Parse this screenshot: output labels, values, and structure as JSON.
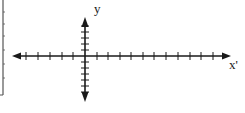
{
  "diagram": {
    "type": "coordinate-axes",
    "labels": {
      "y_axis": "y",
      "x_axis": "x'"
    },
    "colors": {
      "axis": "#1a1a1a",
      "background": "#ffffff",
      "frame": "#555555"
    },
    "x_axis": {
      "y_px": 56,
      "x_start_px": 12,
      "x_end_px": 231,
      "ticks_px": [
        26,
        38,
        50,
        62,
        73,
        97,
        108,
        120,
        131,
        143,
        154,
        166,
        178,
        190,
        201,
        213
      ],
      "arrows": [
        "left",
        "right"
      ]
    },
    "y_axis": {
      "x_px": 85,
      "y_start_px": 17,
      "y_end_px": 102,
      "ticks_px": [
        26,
        32,
        38,
        44,
        50,
        62,
        68,
        74,
        80,
        86,
        92
      ],
      "arrows": [
        "up",
        "down"
      ]
    },
    "left_frame": {
      "x_px": 3,
      "y_top_px": 0,
      "y_bottom_px": 95,
      "ticks_px": [
        12,
        24,
        36,
        50,
        64,
        78
      ]
    }
  }
}
